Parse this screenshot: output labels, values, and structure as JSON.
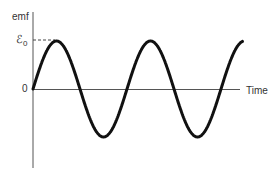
{
  "figure": {
    "y_axis_label": "emf",
    "x_axis_label": "Time",
    "peak_label": "ℰ",
    "peak_label_sub": "0",
    "zero_label": "0"
  },
  "chart_data": {
    "type": "line",
    "title": "",
    "xlabel": "Time",
    "ylabel": "emf",
    "y_ticks": [
      "0",
      "ℰ0"
    ],
    "series": [
      {
        "name": "emf",
        "function": "ℰ0 sin(ωt)",
        "cycles": 2.25
      }
    ],
    "annotations": [
      "dashed line marking peak ℰ0"
    ],
    "grid": false
  },
  "colors": {
    "curve": "#111111",
    "axis": "#555555"
  }
}
